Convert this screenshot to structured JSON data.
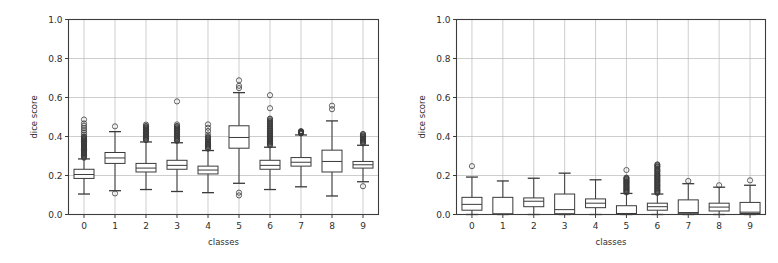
{
  "figure": {
    "background": "#ffffff",
    "panel_count": 2
  },
  "chart_data": [
    {
      "type": "box",
      "panel_index": 0,
      "panel_name": "left-boxplot",
      "title": "",
      "xlabel": "classes",
      "ylabel": "dice score",
      "xlim": [
        -0.5,
        9.5
      ],
      "ylim": [
        0.0,
        1.0
      ],
      "ytick_labels": [
        "0.0",
        "0.2",
        "0.4",
        "0.6",
        "0.8",
        "1.0"
      ],
      "ytick_values": [
        0.0,
        0.2,
        0.4,
        0.6,
        0.8,
        1.0
      ],
      "xtick_labels": [
        "0",
        "1",
        "2",
        "3",
        "4",
        "5",
        "6",
        "7",
        "8",
        "9"
      ],
      "xtick_values": [
        0,
        1,
        2,
        3,
        4,
        5,
        6,
        7,
        8,
        9
      ],
      "grid": true,
      "grid_axis": "both",
      "legend": null,
      "categories": [
        "0",
        "1",
        "2",
        "3",
        "4",
        "5",
        "6",
        "7",
        "8",
        "9"
      ],
      "boxes": [
        {
          "category": "0",
          "whisker_low": 0.105,
          "q1": 0.185,
          "median": 0.205,
          "q3": 0.232,
          "whisker_high": 0.285,
          "fliers_low": [],
          "fliers_high": [
            0.295,
            0.302,
            0.309,
            0.315,
            0.321,
            0.328,
            0.334,
            0.34,
            0.346,
            0.352,
            0.357,
            0.362,
            0.368,
            0.374,
            0.38,
            0.386,
            0.392,
            0.4,
            0.41,
            0.421,
            0.432,
            0.443,
            0.455,
            0.467,
            0.487
          ],
          "flier_density_band": [
            0.29,
            0.4
          ]
        },
        {
          "category": "1",
          "whisker_low": 0.122,
          "q1": 0.262,
          "median": 0.29,
          "q3": 0.318,
          "whisker_high": 0.425,
          "fliers_low": [
            0.108
          ],
          "fliers_high": [
            0.452
          ],
          "flier_density_band": null
        },
        {
          "category": "2",
          "whisker_low": 0.128,
          "q1": 0.218,
          "median": 0.238,
          "q3": 0.262,
          "whisker_high": 0.372,
          "fliers_low": [],
          "fliers_high": [
            0.382,
            0.39,
            0.398,
            0.406,
            0.414,
            0.421,
            0.428,
            0.436,
            0.444,
            0.452,
            0.461
          ],
          "flier_density_band": [
            0.382,
            0.455
          ]
        },
        {
          "category": "3",
          "whisker_low": 0.118,
          "q1": 0.232,
          "median": 0.252,
          "q3": 0.278,
          "whisker_high": 0.368,
          "fliers_low": [],
          "fliers_high": [
            0.378,
            0.386,
            0.394,
            0.402,
            0.41,
            0.418,
            0.426,
            0.434,
            0.442,
            0.452,
            0.462,
            0.58
          ],
          "flier_density_band": [
            0.378,
            0.455
          ]
        },
        {
          "category": "4",
          "whisker_low": 0.112,
          "q1": 0.208,
          "median": 0.228,
          "q3": 0.248,
          "whisker_high": 0.328,
          "fliers_low": [],
          "fliers_high": [
            0.338,
            0.346,
            0.354,
            0.362,
            0.372,
            0.382,
            0.395,
            0.41,
            0.428,
            0.445,
            0.462
          ],
          "flier_density_band": [
            0.338,
            0.4
          ]
        },
        {
          "category": "5",
          "whisker_low": 0.16,
          "q1": 0.34,
          "median": 0.395,
          "q3": 0.455,
          "whisker_high": 0.625,
          "fliers_low": [
            0.098,
            0.112
          ],
          "fliers_high": [
            0.648,
            0.66,
            0.688
          ],
          "flier_density_band": null
        },
        {
          "category": "6",
          "whisker_low": 0.128,
          "q1": 0.232,
          "median": 0.252,
          "q3": 0.278,
          "whisker_high": 0.345,
          "fliers_low": [],
          "fliers_high": [
            0.355,
            0.363,
            0.371,
            0.379,
            0.387,
            0.395,
            0.403,
            0.411,
            0.42,
            0.43,
            0.44,
            0.452,
            0.465,
            0.478,
            0.492,
            0.545,
            0.612
          ],
          "flier_density_band": [
            0.355,
            0.49
          ]
        },
        {
          "category": "7",
          "whisker_low": 0.142,
          "q1": 0.248,
          "median": 0.268,
          "q3": 0.292,
          "whisker_high": 0.408,
          "fliers_low": [],
          "fliers_high": [
            0.418,
            0.426
          ],
          "flier_density_band": [
            0.415,
            0.428
          ]
        },
        {
          "category": "8",
          "whisker_low": 0.095,
          "q1": 0.218,
          "median": 0.272,
          "q3": 0.33,
          "whisker_high": 0.48,
          "fliers_low": [],
          "fliers_high": [
            0.54,
            0.558
          ],
          "flier_density_band": null
        },
        {
          "category": "9",
          "whisker_low": 0.168,
          "q1": 0.238,
          "median": 0.255,
          "q3": 0.272,
          "whisker_high": 0.355,
          "fliers_low": [
            0.145
          ],
          "fliers_high": [
            0.365,
            0.373,
            0.381,
            0.389,
            0.397,
            0.405,
            0.413
          ],
          "flier_density_band": [
            0.365,
            0.412
          ]
        }
      ]
    },
    {
      "type": "box",
      "panel_index": 1,
      "panel_name": "right-boxplot",
      "title": "",
      "xlabel": "classes",
      "ylabel": "dice score",
      "xlim": [
        -0.5,
        9.5
      ],
      "ylim": [
        0.0,
        1.0
      ],
      "ytick_labels": [
        "0.0",
        "0.2",
        "0.4",
        "0.6",
        "0.8",
        "1.0"
      ],
      "ytick_values": [
        0.0,
        0.2,
        0.4,
        0.6,
        0.8,
        1.0
      ],
      "xtick_labels": [
        "0",
        "1",
        "2",
        "3",
        "4",
        "5",
        "6",
        "7",
        "8",
        "9"
      ],
      "xtick_values": [
        0,
        1,
        2,
        3,
        4,
        5,
        6,
        7,
        8,
        9
      ],
      "grid": true,
      "grid_axis": "both",
      "legend": null,
      "categories": [
        "0",
        "1",
        "2",
        "3",
        "4",
        "5",
        "6",
        "7",
        "8",
        "9"
      ],
      "boxes": [
        {
          "category": "0",
          "whisker_low": 0.0,
          "q1": 0.022,
          "median": 0.052,
          "q3": 0.088,
          "whisker_high": 0.192,
          "fliers_low": [],
          "fliers_high": [
            0.248
          ],
          "flier_density_band": null
        },
        {
          "category": "1",
          "whisker_low": 0.0,
          "q1": 0.002,
          "median": 0.003,
          "q3": 0.088,
          "whisker_high": 0.172,
          "fliers_low": [],
          "fliers_high": [],
          "flier_density_band": null
        },
        {
          "category": "2",
          "whisker_low": 0.0,
          "q1": 0.04,
          "median": 0.068,
          "q3": 0.085,
          "whisker_high": 0.186,
          "fliers_low": [],
          "fliers_high": [],
          "flier_density_band": null
        },
        {
          "category": "3",
          "whisker_low": 0.0,
          "q1": 0.004,
          "median": 0.025,
          "q3": 0.105,
          "whisker_high": 0.212,
          "fliers_low": [],
          "fliers_high": [],
          "flier_density_band": null
        },
        {
          "category": "4",
          "whisker_low": 0.0,
          "q1": 0.035,
          "median": 0.058,
          "q3": 0.08,
          "whisker_high": 0.178,
          "fliers_low": [],
          "fliers_high": [],
          "flier_density_band": null
        },
        {
          "category": "5",
          "whisker_low": 0.0,
          "q1": 0.003,
          "median": 0.005,
          "q3": 0.045,
          "whisker_high": 0.108,
          "fliers_low": [],
          "fliers_high": [
            0.115,
            0.122,
            0.128,
            0.134,
            0.14,
            0.146,
            0.152,
            0.158,
            0.164,
            0.17,
            0.176,
            0.182,
            0.188,
            0.228
          ],
          "flier_density_band": [
            0.112,
            0.19
          ]
        },
        {
          "category": "6",
          "whisker_low": 0.0,
          "q1": 0.022,
          "median": 0.04,
          "q3": 0.058,
          "whisker_high": 0.105,
          "fliers_low": [],
          "fliers_high": [
            0.112,
            0.12,
            0.128,
            0.136,
            0.144,
            0.152,
            0.16,
            0.168,
            0.176,
            0.184,
            0.192,
            0.2,
            0.21,
            0.222,
            0.232,
            0.245,
            0.255
          ],
          "flier_density_band": [
            0.11,
            0.258
          ]
        },
        {
          "category": "7",
          "whisker_low": 0.0,
          "q1": 0.004,
          "median": 0.01,
          "q3": 0.075,
          "whisker_high": 0.158,
          "fliers_low": [],
          "fliers_high": [
            0.172
          ],
          "flier_density_band": null
        },
        {
          "category": "8",
          "whisker_low": 0.0,
          "q1": 0.018,
          "median": 0.038,
          "q3": 0.058,
          "whisker_high": 0.14,
          "fliers_low": [],
          "fliers_high": [
            0.15
          ],
          "flier_density_band": null
        },
        {
          "category": "9",
          "whisker_low": 0.0,
          "q1": 0.005,
          "median": 0.012,
          "q3": 0.062,
          "whisker_high": 0.15,
          "fliers_low": [],
          "fliers_high": [
            0.175
          ],
          "flier_density_band": null
        }
      ]
    }
  ],
  "colors": {
    "axis": "#3c3c3c",
    "grid": "#b9b9b9",
    "box_edge": "#3a3a3a",
    "box_fill": "#ffffff",
    "background": "#ffffff"
  }
}
